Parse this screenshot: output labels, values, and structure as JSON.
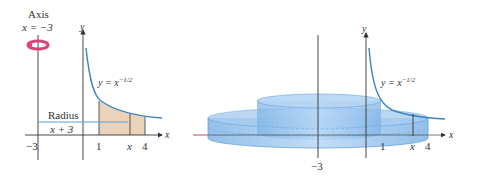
{
  "left_panel": {
    "axis_label_line1": "Axis",
    "axis_label_line2": "x = −3",
    "y_axis_label": "y",
    "x_axis_label": "x",
    "curve_label": "y = x",
    "curve_exponent": "−1/2",
    "radius_label": "Radius",
    "radius_expr": "x + 3",
    "ticks": [
      "−3",
      "1",
      "x",
      "4"
    ]
  },
  "right_panel": {
    "y_axis_label": "y",
    "x_axis_label": "x",
    "curve_label": "y = x",
    "curve_exponent": "−1/2",
    "ticks": [
      "1",
      "x",
      "4"
    ],
    "axis_tick": "−3"
  },
  "colors": {
    "curve": "#3b82c4",
    "shade": "#e8cdb4",
    "solid": "#8fc0ec",
    "ring": "#e0407a",
    "axis": "#333333"
  }
}
